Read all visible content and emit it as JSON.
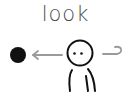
{
  "caption": "look",
  "figure": {
    "target": "black-dot",
    "arrow_direction": "left",
    "colors": {
      "ink": "#111111",
      "arrow": "#9a9a9a",
      "text": "#4a4a4a"
    }
  }
}
